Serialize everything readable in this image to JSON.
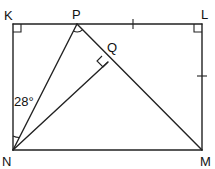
{
  "diagram": {
    "type": "geometry",
    "shape": "rectangle KLMN with segments NP, PM, NQ",
    "points": {
      "K": {
        "label": "K",
        "x": 13,
        "y": 24
      },
      "P": {
        "label": "P",
        "x": 77,
        "y": 24
      },
      "L": {
        "label": "L",
        "x": 202,
        "y": 24
      },
      "Q": {
        "label": "Q",
        "x": 108,
        "y": 62
      },
      "N": {
        "label": "N",
        "x": 13,
        "y": 150
      },
      "M": {
        "label": "M",
        "x": 202,
        "y": 150
      }
    },
    "angle_label": "28°",
    "annotations": [
      "right angle at K",
      "right angle at L",
      "right angle at Q (NQ perpendicular to PM)",
      "angle KNP = 28°",
      "angle NPM marked",
      "PL = LM (tick marks)"
    ]
  }
}
